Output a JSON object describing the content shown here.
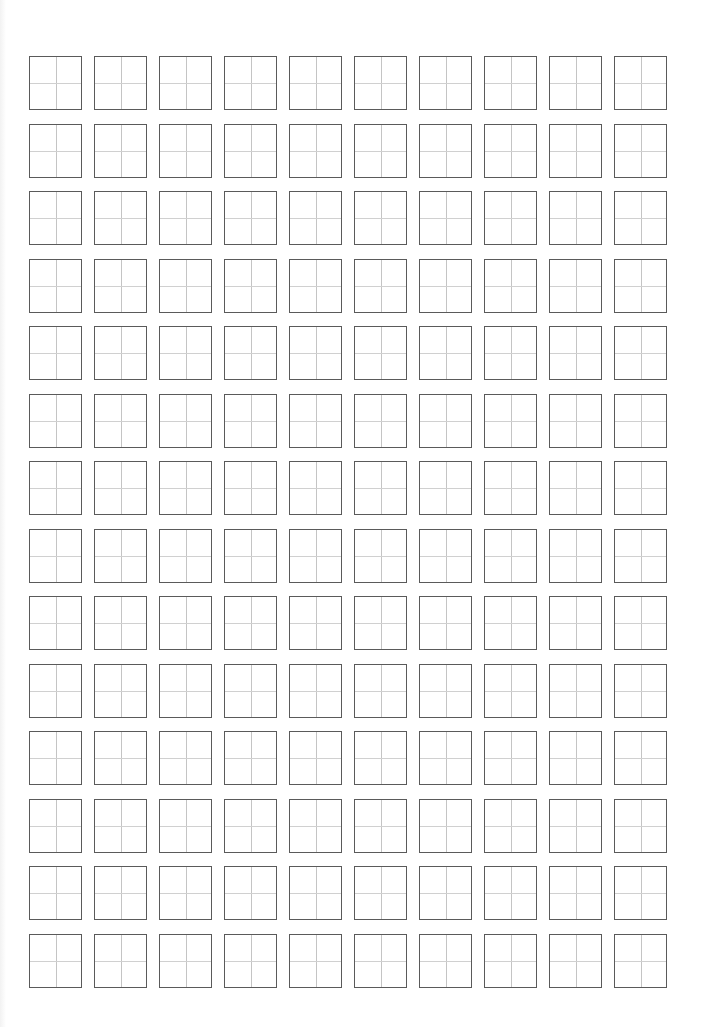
{
  "sheet": {
    "type": "tianzige-practice-grid",
    "rows": 14,
    "columns": 10,
    "cell_size_px": 53,
    "border_color": "#5a5a5a",
    "guide_line_color": "#c4c4c4",
    "background": "#ffffff",
    "cells_content": ""
  }
}
